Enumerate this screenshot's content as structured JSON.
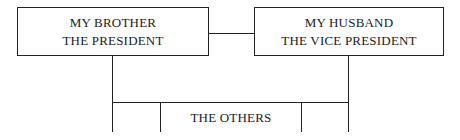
{
  "diagram": {
    "type": "org-chart",
    "nodes": [
      {
        "id": "brother",
        "lines": [
          "MY BROTHER",
          "THE PRESIDENT"
        ]
      },
      {
        "id": "husband",
        "lines": [
          "MY HUSBAND",
          "THE VICE PRESIDENT"
        ]
      },
      {
        "id": "others",
        "label": "THE OTHERS"
      }
    ],
    "edges": [
      {
        "from": "brother",
        "to": "husband",
        "style": "horizontal-link"
      },
      {
        "from": "brother",
        "to": "others",
        "style": "vertical-drop"
      },
      {
        "from": "husband",
        "to": "others",
        "style": "vertical-drop"
      }
    ],
    "colors": {
      "line": "#222222",
      "text": "#1a1a1a",
      "background": "#ffffff"
    }
  }
}
